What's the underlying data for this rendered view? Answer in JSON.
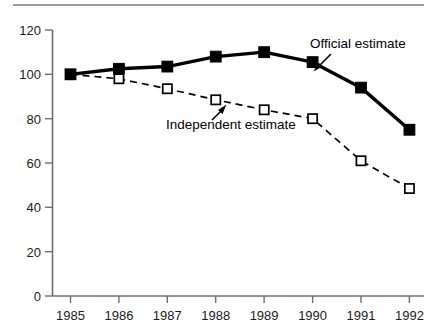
{
  "figure": {
    "has_top_rule": true,
    "background_color": "#ffffff",
    "axis_color": "#6d6d6d"
  },
  "chart_data": {
    "type": "line",
    "title": "",
    "subtitle": "",
    "xlabel": "",
    "ylabel": "",
    "categories": [
      "1985",
      "1986",
      "1987",
      "1988",
      "1989",
      "1990",
      "1991",
      "1992"
    ],
    "x_tick_labels": [
      "1985",
      "1986",
      "1987",
      "1988",
      "1989",
      "1990",
      "1991",
      "1992"
    ],
    "y_tick_labels": [
      "0",
      "20",
      "40",
      "60",
      "80",
      "100",
      "120"
    ],
    "y_ticks": [
      0,
      20,
      40,
      60,
      80,
      100,
      120
    ],
    "ylim": [
      0,
      120
    ],
    "xlim": [
      "1985",
      "1992"
    ],
    "grid": false,
    "legend_position": "inline-annotations",
    "series": [
      {
        "name": "Official estimate",
        "marker": "filled-square",
        "line_style": "solid",
        "color": "#000000",
        "values": [
          100,
          102.5,
          103.5,
          108,
          110,
          105.5,
          94,
          75
        ]
      },
      {
        "name": "Independent estimate",
        "marker": "open-square",
        "line_style": "dashed",
        "color": "#000000",
        "values": [
          100,
          98,
          93.5,
          88.5,
          84,
          80,
          61,
          48.5
        ]
      }
    ],
    "annotations": [
      {
        "text": "Official estimate",
        "points_to_series": "Official estimate",
        "points_to_category": "1990"
      },
      {
        "text": "Independent estimate",
        "points_to_series": "Independent estimate",
        "points_to_category": "1988"
      }
    ]
  },
  "labels": {
    "y": {
      "t0": "0",
      "t20": "20",
      "t40": "40",
      "t60": "60",
      "t80": "80",
      "t100": "100",
      "t120": "120"
    },
    "x": {
      "x1985": "1985",
      "x1986": "1986",
      "x1987": "1987",
      "x1988": "1988",
      "x1989": "1989",
      "x1990": "1990",
      "x1991": "1991",
      "x1992": "1992"
    },
    "annotation_official": "Official estimate",
    "annotation_independent": "Independent estimate"
  }
}
